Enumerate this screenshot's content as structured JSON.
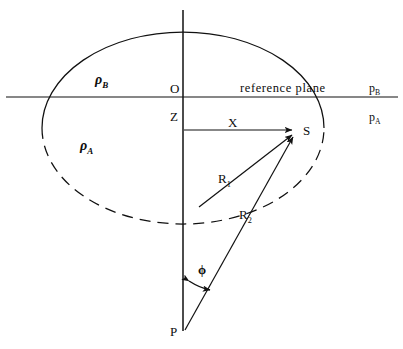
{
  "figure": {
    "type": "geometry-diagram",
    "background_color": "#ffffff",
    "stroke_color": "#111111"
  },
  "labels": {
    "origin": "O",
    "depth": "Z",
    "radial": "X",
    "surface_point": "S",
    "apex": "P",
    "radius_1": "R",
    "radius_1_sub": "1",
    "radius_2": "R",
    "radius_2_sub": "2",
    "angle": "ϕ",
    "density_upper": "ρ",
    "density_upper_sub": "B",
    "density_lower": "ρ",
    "density_lower_sub": "A",
    "pressure_upper": "p",
    "pressure_upper_sub": "B",
    "pressure_lower": "p",
    "pressure_lower_sub": "A",
    "reference_plane": "reference  plane"
  },
  "geometry": {
    "reference_plane_y": 97,
    "axis_x": 183,
    "axis_top_y": 10,
    "axis_bottom_y": 331,
    "ellipse_center": [
      183,
      128
    ],
    "ellipse_rx": 141,
    "ellipse_ry": 96,
    "point_S": [
      297,
      130
    ],
    "point_P": [
      185,
      330
    ],
    "point_O": [
      183,
      97
    ],
    "r1_start": [
      199,
      207
    ],
    "phi_arrow_y": 285
  }
}
